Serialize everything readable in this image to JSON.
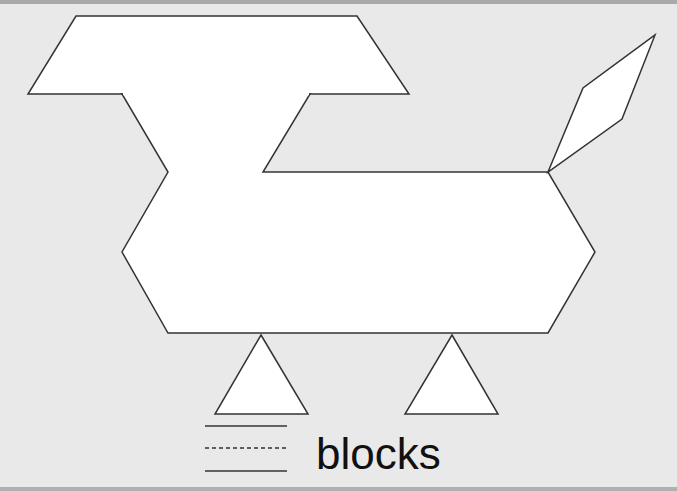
{
  "worksheet": {
    "word": "blocks",
    "answer_lines": [
      {
        "style": "solid"
      },
      {
        "style": "dashed"
      },
      {
        "style": "solid"
      }
    ],
    "figure": {
      "description": "animal figure built from pattern blocks",
      "shapes": [
        {
          "type": "trapezoid",
          "role": "head"
        },
        {
          "type": "body-outline",
          "role": "neck-and-body"
        },
        {
          "type": "rhombus",
          "role": "tail"
        },
        {
          "type": "triangle",
          "role": "front-leg"
        },
        {
          "type": "triangle",
          "role": "back-leg"
        }
      ]
    },
    "colors": {
      "background": "#e9e9e9",
      "shape_fill": "#ffffff",
      "outline": "#333333",
      "text": "#111111"
    }
  }
}
